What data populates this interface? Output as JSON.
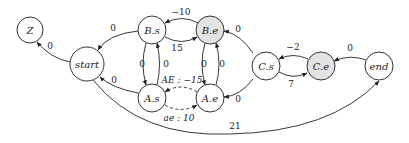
{
  "diagram": {
    "type": "state-graph",
    "nodes": [
      {
        "id": "Z",
        "label": "Z",
        "shaded": false
      },
      {
        "id": "start",
        "label": "start",
        "shaded": false
      },
      {
        "id": "Bs",
        "label": "B.s",
        "shaded": false
      },
      {
        "id": "Be",
        "label": "B.e",
        "shaded": true
      },
      {
        "id": "As",
        "label": "A.s",
        "shaded": false
      },
      {
        "id": "Ae",
        "label": "A.e",
        "shaded": false
      },
      {
        "id": "Cs",
        "label": "C.s",
        "shaded": false
      },
      {
        "id": "Ce",
        "label": "C.e",
        "shaded": true
      },
      {
        "id": "end",
        "label": "end",
        "shaded": false
      }
    ],
    "edges": [
      {
        "from": "start",
        "to": "Z",
        "label": "0",
        "style": "solid"
      },
      {
        "from": "Bs",
        "to": "start",
        "label": "0",
        "style": "solid"
      },
      {
        "from": "As",
        "to": "start",
        "label": "0",
        "style": "solid"
      },
      {
        "from": "Be",
        "to": "Bs",
        "label": "−10",
        "style": "solid"
      },
      {
        "from": "Bs",
        "to": "Be",
        "label": "15",
        "style": "solid"
      },
      {
        "from": "Bs",
        "to": "As",
        "label": "0",
        "style": "solid"
      },
      {
        "from": "As",
        "to": "Bs",
        "label": "0",
        "style": "solid"
      },
      {
        "from": "Be",
        "to": "Ae",
        "label": "0",
        "style": "solid"
      },
      {
        "from": "Ae",
        "to": "Be",
        "label": "0",
        "style": "solid"
      },
      {
        "from": "Ae",
        "to": "As",
        "label": "AE : −15",
        "style": "dashed"
      },
      {
        "from": "As",
        "to": "Ae",
        "label": "ae : 10",
        "style": "dashed"
      },
      {
        "from": "Cs",
        "to": "Be",
        "label": "0",
        "style": "solid"
      },
      {
        "from": "Cs",
        "to": "Ae",
        "label": "0",
        "style": "solid"
      },
      {
        "from": "Ce",
        "to": "Cs",
        "label": "−2",
        "style": "solid"
      },
      {
        "from": "Cs",
        "to": "Ce",
        "label": "7",
        "style": "solid"
      },
      {
        "from": "end",
        "to": "Ce",
        "label": "0",
        "style": "solid"
      },
      {
        "from": "start",
        "to": "end",
        "label": "21",
        "style": "solid"
      }
    ]
  }
}
